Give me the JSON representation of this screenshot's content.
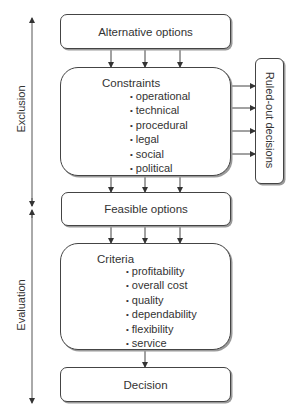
{
  "diagram": {
    "side_labels": {
      "exclusion": "Exclusion",
      "evaluation": "Evaluation"
    },
    "nodes": {
      "alternative_options": "Alternative options",
      "constraints": {
        "title": "Constraints",
        "items": [
          "operational",
          "technical",
          "procedural",
          "legal",
          "social",
          "political"
        ]
      },
      "ruled_out": "Ruled-out decisions",
      "feasible_options": "Feasible options",
      "criteria": {
        "title": "Criteria",
        "items": [
          "profitability",
          "overall cost",
          "quality",
          "dependability",
          "flexibility",
          "service"
        ]
      },
      "decision": "Decision"
    },
    "edges": [
      {
        "from": "alternative_options",
        "to": "constraints",
        "count": 3
      },
      {
        "from": "constraints",
        "to": "ruled_out",
        "count": 4
      },
      {
        "from": "constraints",
        "to": "feasible_options",
        "count": 3
      },
      {
        "from": "feasible_options",
        "to": "criteria",
        "count": 3
      },
      {
        "from": "criteria",
        "to": "decision",
        "count": 1
      }
    ],
    "colors": {
      "stroke": "#444444",
      "shadow": "#9a9a9a",
      "text": "#333333"
    }
  }
}
